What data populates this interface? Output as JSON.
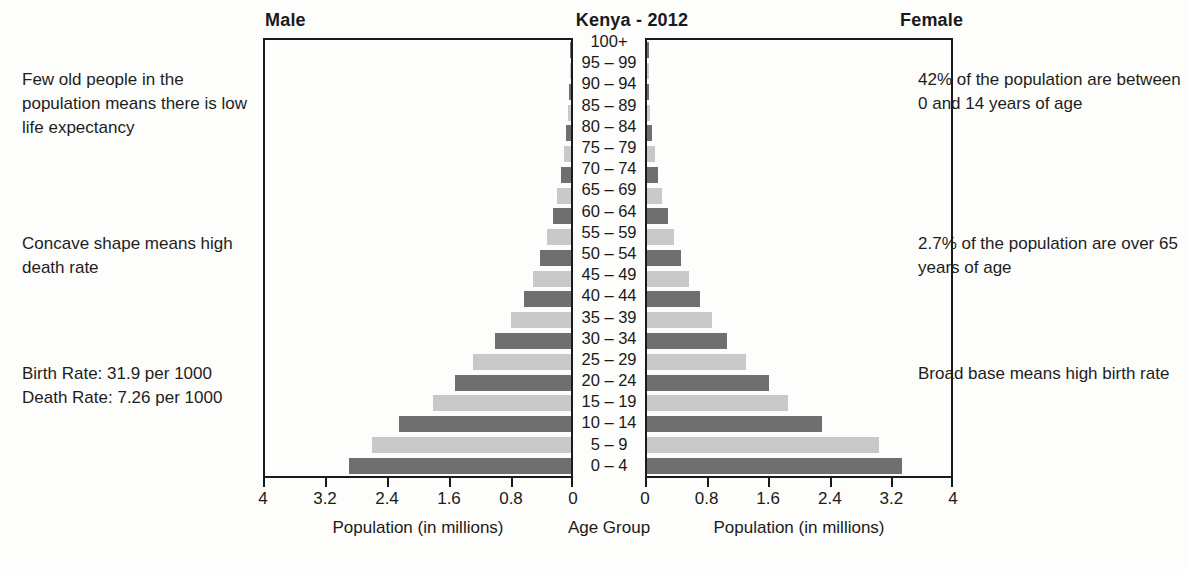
{
  "headings": {
    "male": "Male",
    "title": "Kenya - 2012",
    "female": "Female"
  },
  "annotations": {
    "left": [
      "Few old people in the population means there is low life expectancy",
      "Concave shape means high death rate",
      "Birth Rate: 31.9 per 1000\nDeath Rate: 7.26 per 1000"
    ],
    "right": [
      "42% of the population are between 0 and 14 years of age",
      "2.7% of the population are over 65 years of age",
      "Broad base means high birth rate"
    ]
  },
  "axis_captions": {
    "male": "Population (in millions)",
    "center": "Age Group",
    "female": "Population (in millions)"
  },
  "tick_labels": {
    "male": [
      "4",
      "3.2",
      "2.4",
      "1.6",
      "0.8",
      "0"
    ],
    "female": [
      "0",
      "0.8",
      "1.6",
      "2.4",
      "3.2",
      "4"
    ]
  },
  "colors": {
    "bar_light": "#c9c9c9",
    "bar_dark": "#6f6f6f",
    "axis": "#1a1a1a",
    "text": "#1a1a1a",
    "background": "#fdfdfb"
  },
  "chart_data": {
    "type": "bar",
    "title": "Kenya - 2012",
    "subtype": "population-pyramid",
    "xlabel": "Population (in millions)",
    "ylabel": "Age Group",
    "xlim": [
      0,
      4
    ],
    "xticks": [
      0,
      0.8,
      1.6,
      2.4,
      3.2,
      4
    ],
    "grid": false,
    "legend": "none",
    "categories": [
      "100+",
      "95 – 99",
      "90 – 94",
      "85 – 89",
      "80 – 84",
      "75 – 79",
      "70 – 74",
      "65 – 69",
      "60 – 64",
      "55 – 59",
      "50 – 54",
      "45 – 49",
      "40 – 44",
      "35 – 39",
      "30 – 34",
      "25 – 29",
      "20 – 24",
      "15 – 19",
      "10 – 14",
      "5 – 9",
      "0 – 4"
    ],
    "series": [
      {
        "name": "Male",
        "side": "left",
        "values": [
          0.005,
          0.01,
          0.02,
          0.035,
          0.06,
          0.09,
          0.13,
          0.18,
          0.24,
          0.31,
          0.4,
          0.5,
          0.62,
          0.78,
          1.0,
          1.28,
          1.52,
          1.8,
          2.25,
          2.6,
          2.9
        ]
      },
      {
        "name": "Female",
        "side": "right",
        "values": [
          0.005,
          0.012,
          0.025,
          0.045,
          0.07,
          0.1,
          0.145,
          0.2,
          0.27,
          0.35,
          0.45,
          0.55,
          0.7,
          0.85,
          1.05,
          1.3,
          1.6,
          1.85,
          2.3,
          3.05,
          3.35
        ]
      }
    ],
    "annotations": [
      "Few old people in the population means there is low life expectancy",
      "Concave shape means high death rate",
      "Birth Rate: 31.9 per 1000",
      "Death Rate: 7.26 per 1000",
      "42% of the population are between 0 and 14 years of age",
      "2.7% of the population are over 65 years of age",
      "Broad base means high birth rate"
    ]
  }
}
